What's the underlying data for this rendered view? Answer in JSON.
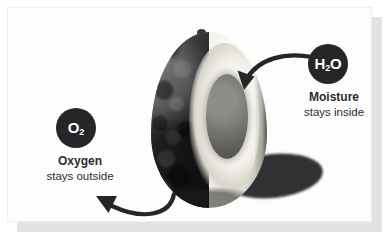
{
  "card": {
    "background_color": "#fdfdfd",
    "shadow_color": "#c9cbcd"
  },
  "figure": {
    "accent_color": "#242628"
  },
  "callouts": [
    {
      "id": "oxygen",
      "badge_formula_main": "O",
      "badge_formula_sub": "2",
      "badge_label": "O2",
      "title": "Oxygen",
      "subtitle": "stays outside",
      "badge_color": "#242628",
      "arrow": "curved-arrow-pointing-up-left"
    },
    {
      "id": "moisture",
      "badge_formula_prefix": "H",
      "badge_formula_sub": "2",
      "badge_formula_suffix": "O",
      "badge_label": "H2O",
      "title": "Moisture",
      "subtitle": "stays inside",
      "badge_color": "#242628",
      "arrow": "curved-arrow-pointing-down-left"
    }
  ]
}
